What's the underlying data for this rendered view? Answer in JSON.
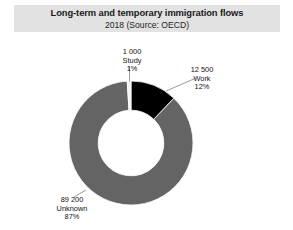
{
  "header": {
    "title": "Long-term and temporary immigration flows",
    "subtitle": "2018 (Source: OECD)"
  },
  "chart_data": {
    "type": "pie",
    "variant": "donut",
    "title": "Long-term and temporary immigration flows",
    "subtitle": "2018 (Source: OECD)",
    "xlabel": "",
    "ylabel": "",
    "legend": "none",
    "grid": false,
    "total": 102700,
    "start_angle_deg": 0,
    "direction": "clockwise",
    "inner_radius_ratio": 0.53,
    "categories": [
      "Study",
      "Work",
      "Unknown"
    ],
    "values": [
      1000,
      12500,
      89200
    ],
    "percentages": [
      1,
      12,
      87
    ],
    "slices": [
      {
        "name": "Study",
        "value": 1000,
        "value_text": "1 000",
        "percent": 1,
        "percent_text": "1%",
        "color": "#f2f2f2"
      },
      {
        "name": "Work",
        "value": 12500,
        "value_text": "12 500",
        "percent": 12,
        "percent_text": "12%",
        "color": "#000000"
      },
      {
        "name": "Unknown",
        "value": 89200,
        "value_text": "89 200",
        "percent": 87,
        "percent_text": "87%",
        "color": "#646464"
      }
    ]
  },
  "colors": {
    "title_band": "#e2e2e2",
    "page_background": "#ffffff",
    "slice_work": "#000000",
    "slice_unknown": "#646464",
    "slice_study": "#f2f2f2",
    "leader_line": "#8a8a8a",
    "text": "#111111"
  }
}
